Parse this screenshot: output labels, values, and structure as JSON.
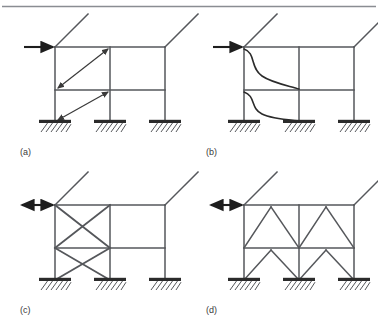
{
  "figure": {
    "type": "engineering-diagram",
    "top_rule": true,
    "background_color": "#ffffff",
    "line_color": "#55575b",
    "ground_color": "#2b2b2b",
    "panel_count": 4
  },
  "panels": [
    {
      "id": "a",
      "label": "(a)",
      "system": "moment-resisting-frame",
      "arrow": {
        "name": "lateral-load-arrow",
        "style": "single-head",
        "direction": "right"
      },
      "annotation": "diagonal double-headed drift arrows across left bay at each story",
      "diagonal_arrows": 2
    },
    {
      "id": "b",
      "label": "(b)",
      "system": "deflected-shape-moment-frame",
      "arrow": {
        "name": "lateral-load-arrow",
        "style": "single-head",
        "direction": "right"
      },
      "annotation": "S-shaped column deflection curves for both stories",
      "deflection_curves": 2
    },
    {
      "id": "c",
      "label": "(c)",
      "system": "x-braced-frame",
      "arrow": {
        "name": "lateral-load-arrow",
        "style": "double-head",
        "direction": "horizontal"
      },
      "annotation": "cross (X) bracing in left bay, both stories",
      "brace_count": 4
    },
    {
      "id": "d",
      "label": "(d)",
      "system": "chevron-braced-frame",
      "arrow": {
        "name": "lateral-load-arrow",
        "style": "double-head",
        "direction": "horizontal"
      },
      "annotation": "inverted-V (chevron) bracing in both bays, both stories",
      "brace_count": 8
    }
  ],
  "geometry": {
    "columns_x": [
      55,
      110,
      165
    ],
    "roof_level_y": 47,
    "mid_level_y": 90,
    "base_level_y": 122,
    "support_type": "fixed-base-with-hatching",
    "support_count_per_panel": 3,
    "roof_stub_angle_deg": 45
  }
}
